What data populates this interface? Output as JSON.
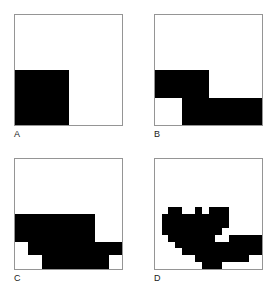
{
  "figure": {
    "background_color": "#ffffff",
    "fill_color": "#000000",
    "frame_color": "#959595",
    "label_color": "#1a1a1a"
  },
  "chart_data": {
    "type": "heatmap",
    "title": "",
    "xlabel": "",
    "ylabel": "",
    "legend": [
      {
        "label": "filled",
        "color": "#000000",
        "value": 1
      },
      {
        "label": "empty",
        "color": "#ffffff",
        "value": 0
      }
    ],
    "panels": [
      {
        "label": "A",
        "resolution": 2,
        "columns": 2,
        "rows": 2,
        "filled_count": 1,
        "cells": [
          [
            0,
            0
          ],
          [
            1,
            0
          ]
        ]
      },
      {
        "label": "B",
        "resolution": 4,
        "columns": 4,
        "rows": 4,
        "filled_count": 5,
        "cells": [
          [
            0,
            0,
            0,
            0
          ],
          [
            0,
            0,
            0,
            0
          ],
          [
            1,
            1,
            0,
            0
          ],
          [
            0,
            1,
            1,
            1
          ]
        ]
      },
      {
        "label": "C",
        "resolution": 8,
        "columns": 8,
        "rows": 8,
        "filled_count": 29,
        "cells": [
          [
            0,
            0,
            0,
            0,
            0,
            0,
            0,
            0
          ],
          [
            0,
            0,
            0,
            0,
            0,
            0,
            0,
            0
          ],
          [
            0,
            0,
            0,
            0,
            0,
            0,
            0,
            0
          ],
          [
            0,
            0,
            0,
            0,
            0,
            0,
            0,
            0
          ],
          [
            1,
            1,
            1,
            1,
            1,
            1,
            0,
            0
          ],
          [
            1,
            1,
            1,
            1,
            1,
            1,
            0,
            0
          ],
          [
            0,
            1,
            1,
            1,
            1,
            1,
            1,
            1
          ],
          [
            0,
            0,
            1,
            1,
            1,
            1,
            1,
            0
          ]
        ]
      },
      {
        "label": "D",
        "resolution": 16,
        "columns": 16,
        "rows": 16,
        "filled_count": 100,
        "cells": [
          [
            0,
            0,
            0,
            0,
            0,
            0,
            0,
            0,
            0,
            0,
            0,
            0,
            0,
            0,
            0,
            0
          ],
          [
            0,
            0,
            0,
            0,
            0,
            0,
            0,
            0,
            0,
            0,
            0,
            0,
            0,
            0,
            0,
            0
          ],
          [
            0,
            0,
            0,
            0,
            0,
            0,
            0,
            0,
            0,
            0,
            0,
            0,
            0,
            0,
            0,
            0
          ],
          [
            0,
            0,
            0,
            0,
            0,
            0,
            0,
            0,
            0,
            0,
            0,
            0,
            0,
            0,
            0,
            0
          ],
          [
            0,
            0,
            0,
            0,
            0,
            0,
            0,
            0,
            0,
            0,
            0,
            0,
            0,
            0,
            0,
            0
          ],
          [
            0,
            0,
            0,
            0,
            0,
            0,
            0,
            0,
            0,
            0,
            0,
            0,
            0,
            0,
            0,
            0
          ],
          [
            0,
            0,
            0,
            0,
            0,
            0,
            0,
            0,
            0,
            0,
            0,
            0,
            0,
            0,
            0,
            0
          ],
          [
            0,
            0,
            1,
            1,
            0,
            0,
            1,
            0,
            1,
            1,
            1,
            0,
            0,
            0,
            0,
            0
          ],
          [
            0,
            1,
            1,
            1,
            1,
            1,
            1,
            1,
            1,
            1,
            1,
            0,
            0,
            0,
            0,
            0
          ],
          [
            0,
            1,
            1,
            1,
            1,
            1,
            1,
            1,
            1,
            1,
            1,
            0,
            0,
            0,
            0,
            0
          ],
          [
            0,
            1,
            1,
            1,
            1,
            1,
            1,
            1,
            1,
            1,
            0,
            0,
            0,
            0,
            0,
            0
          ],
          [
            0,
            0,
            1,
            1,
            1,
            1,
            1,
            1,
            1,
            0,
            0,
            1,
            1,
            1,
            1,
            1
          ],
          [
            0,
            0,
            0,
            1,
            1,
            1,
            1,
            1,
            1,
            1,
            1,
            1,
            1,
            1,
            1,
            1
          ],
          [
            0,
            0,
            0,
            0,
            1,
            1,
            1,
            1,
            1,
            1,
            1,
            1,
            1,
            1,
            1,
            1
          ],
          [
            0,
            0,
            0,
            0,
            0,
            0,
            1,
            1,
            1,
            1,
            1,
            1,
            1,
            1,
            0,
            0
          ],
          [
            0,
            0,
            0,
            0,
            0,
            0,
            0,
            1,
            1,
            1,
            0,
            0,
            0,
            0,
            0,
            0
          ]
        ]
      }
    ]
  }
}
